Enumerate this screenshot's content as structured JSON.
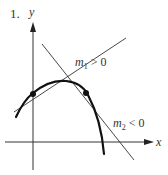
{
  "figure": {
    "number_label": "1.",
    "axes": {
      "x_label": "x",
      "y_label": "y"
    },
    "tangents": [
      {
        "name": "m1",
        "base": "m",
        "subscript": "1",
        "relation": " > 0",
        "slope_sign": "positive"
      },
      {
        "name": "m2",
        "base": "m",
        "subscript": "2",
        "relation": " < 0",
        "slope_sign": "negative"
      }
    ],
    "curve": "concave-down parabola",
    "points_of_tangency": 2,
    "colors": {
      "ink": "#222222",
      "background": "#ffffff"
    }
  }
}
